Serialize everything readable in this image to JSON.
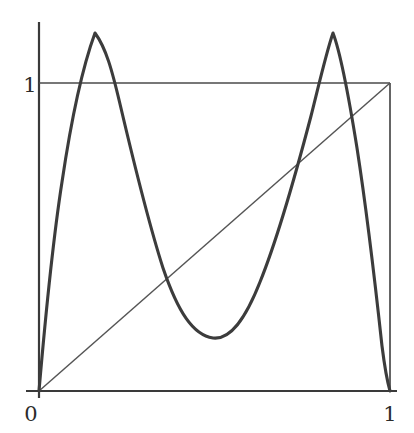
{
  "figure": {
    "title": "",
    "background_color": "#ffffff",
    "width": 414,
    "height": 433
  },
  "axes": {
    "x_label": "",
    "y_label": "",
    "x_ticks": [
      {
        "value": 0,
        "label": "0",
        "px": 39
      },
      {
        "value": 1,
        "label": "1",
        "px": 390
      }
    ],
    "y_ticks": [
      {
        "value": 1,
        "label": "1",
        "px": 83
      }
    ],
    "origin_px": {
      "x": 39,
      "y": 391
    },
    "unit_px": {
      "x": 390,
      "y": 83
    },
    "xlim": [
      0,
      1
    ],
    "ylim": [
      0,
      1.18
    ],
    "grid": false,
    "axis_color": "#3a3a3a",
    "box_color": "#4a4a4a"
  },
  "labels": {
    "x_zero": "0",
    "x_one": "1",
    "y_one": "1"
  },
  "chart_data": {
    "type": "line",
    "title": "",
    "subtitle": "",
    "xlabel": "",
    "ylabel": "",
    "xlim": [
      0,
      1
    ],
    "ylim": [
      0,
      1.18
    ],
    "grid": false,
    "legend": null,
    "legend_position": "none",
    "xticks": [
      0,
      1
    ],
    "xticklabels": [
      "0",
      "1"
    ],
    "yticks": [
      1
    ],
    "yticklabels": [
      "1"
    ],
    "annotations": [
      {
        "text": "unit box top edge at y = 1",
        "y": 1
      },
      {
        "text": "right edge at x = 1",
        "x": 1
      }
    ],
    "series": [
      {
        "name": "second iterate of logistic map",
        "type": "line",
        "color": "#3c3c3c",
        "linewidth": 3.1,
        "x": [
          0.0,
          0.02,
          0.04,
          0.06,
          0.08,
          0.094,
          0.1,
          0.12,
          0.14,
          0.16,
          0.159,
          0.18,
          0.2,
          0.22,
          0.228,
          0.24,
          0.26,
          0.28,
          0.3,
          0.32,
          0.34,
          0.36,
          0.38,
          0.4,
          0.42,
          0.44,
          0.46,
          0.48,
          0.5,
          0.52,
          0.54,
          0.56,
          0.58,
          0.6,
          0.62,
          0.64,
          0.66,
          0.68,
          0.7,
          0.72,
          0.74,
          0.76,
          0.772,
          0.78,
          0.8,
          0.82,
          0.838,
          0.86,
          0.88,
          0.9,
          0.92,
          0.94,
          0.96,
          0.98,
          1.0
        ],
        "y": [
          0.0,
          0.285,
          0.556,
          0.8,
          0.985,
          1.095,
          1.12,
          1.155,
          1.118,
          1.02,
          1.03,
          0.89,
          0.735,
          0.58,
          0.52,
          0.43,
          0.3,
          0.195,
          0.12,
          0.07,
          0.04,
          0.025,
          0.018,
          0.02,
          0.032,
          0.05,
          0.072,
          0.095,
          0.112,
          0.122,
          0.125,
          0.12,
          0.108,
          0.108,
          0.135,
          0.19,
          0.27,
          0.375,
          0.5,
          0.64,
          0.79,
          0.94,
          1.01,
          1.055,
          1.125,
          1.15,
          1.155,
          1.1,
          0.985,
          0.83,
          0.64,
          0.43,
          0.23,
          0.07,
          0.0
        ],
        "description": "Steeply rising at x=0 to a first maximum near x=0.16 above the line y=1, falling to a broad minimum near x=0.50, rising again to a second maximum near x=0.84 above y=1, then falling steeply to 0 at x=1"
      },
      {
        "name": "diagonal y = x",
        "type": "line",
        "color": "#555555",
        "linewidth": 1.5,
        "x": [
          0,
          1
        ],
        "y": [
          0,
          1
        ]
      }
    ]
  },
  "geometry": {
    "curve_path": "M 39,391 C 44,333 52,246 62,182 C 70,128 80,74 95,33 C 106,48 112,70 120,104 C 132,155 147,218 163,268 C 178,312 193,335 213,338 C 230,340 245,320 260,282 C 277,240 295,177 311,116 C 320,80 327,50 333,33 C 341,54 349,98 357,148 C 366,206 377,300 382,346 C 385,370 388,384 390,391",
    "diagonal_path": "M 39,391 L 390,83",
    "box_top_path": "M 39,83 L 390,83",
    "box_right_path": "M 390,83 L 390,391",
    "y_axis_path": "M 39,22 L 39,398",
    "x_axis_path": "M 26,391 L 397,391"
  }
}
